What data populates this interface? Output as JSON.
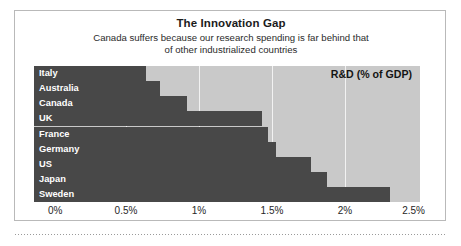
{
  "chart_data": {
    "type": "bar",
    "orientation": "horizontal",
    "title": "The Innovation Gap",
    "subtitle_lines": [
      "Canada suffers because our research spending is far behind that",
      "of other industrialized countries"
    ],
    "annotation": "R&D (% of GDP)",
    "xlabel": "",
    "ylabel": "",
    "categories": [
      "Italy",
      "Australia",
      "Canada",
      "UK",
      "France",
      "Germany",
      "US",
      "Japan",
      "Sweden"
    ],
    "values": [
      0.64,
      0.73,
      0.92,
      1.43,
      1.47,
      1.53,
      1.77,
      1.88,
      2.31
    ],
    "value_unit": "%",
    "xlim": [
      0,
      2.5
    ],
    "xticks": [
      0,
      0.5,
      1,
      1.5,
      2,
      2.5
    ],
    "xtick_labels": [
      "0%",
      "0.5%",
      "1%",
      "1.5%",
      "2%",
      "2.5%"
    ],
    "gridlines": [
      0.5,
      1,
      1.5,
      2
    ],
    "grid": true,
    "legend": "none",
    "colors": {
      "bar": "#484848",
      "plot_background": "#c9c9c9",
      "gridline": "#f2f2f2",
      "bar_label_text": "#ffffff",
      "figure_background": "#ffffff",
      "frame_border": "#b9b9b9",
      "title_text": "#1b1b1b",
      "subtitle_text": "#2b2b2b",
      "tick_text": "#262626"
    }
  }
}
